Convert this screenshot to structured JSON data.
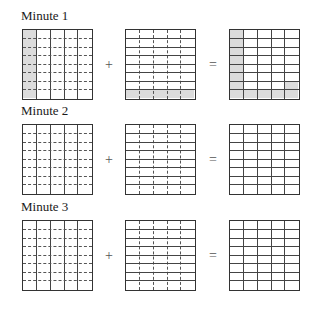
{
  "figure": {
    "rows": 8,
    "cols": 5,
    "shade_color": "#dcdcdc",
    "line_color": "#333333",
    "operators": {
      "plus": "+",
      "equals": "="
    },
    "panels": [
      {
        "title": "Minute 1",
        "left": {
          "solid": "vertical",
          "dashed": "horizontal",
          "shaded_cells": [
            [
              0,
              0
            ],
            [
              1,
              0
            ],
            [
              2,
              0
            ],
            [
              3,
              0
            ],
            [
              4,
              0
            ],
            [
              5,
              0
            ],
            [
              6,
              0
            ],
            [
              7,
              0
            ]
          ]
        },
        "middle": {
          "solid": "horizontal",
          "dashed": "vertical",
          "shaded_cells": [
            [
              7,
              0
            ],
            [
              7,
              1
            ],
            [
              7,
              2
            ],
            [
              7,
              3
            ],
            [
              7,
              4
            ]
          ]
        },
        "result": {
          "solid": "both",
          "shaded_cells": [
            [
              0,
              0
            ],
            [
              1,
              0
            ],
            [
              2,
              0
            ],
            [
              3,
              0
            ],
            [
              4,
              0
            ],
            [
              5,
              0
            ],
            [
              6,
              0
            ],
            [
              7,
              0
            ],
            [
              7,
              1
            ],
            [
              7,
              2
            ],
            [
              7,
              3
            ],
            [
              7,
              4
            ],
            [
              6,
              4
            ]
          ]
        }
      },
      {
        "title": "Minute 2",
        "left": {
          "solid": "vertical",
          "dashed": "horizontal",
          "shaded_cells": []
        },
        "middle": {
          "solid": "horizontal",
          "dashed": "vertical",
          "shaded_cells": []
        },
        "result": {
          "solid": "both",
          "shaded_cells": []
        }
      },
      {
        "title": "Minute 3",
        "left": {
          "solid": "vertical",
          "dashed": "horizontal",
          "shaded_cells": []
        },
        "middle": {
          "solid": "horizontal",
          "dashed": "vertical",
          "shaded_cells": []
        },
        "result": {
          "solid": "both",
          "shaded_cells": []
        }
      }
    ]
  }
}
